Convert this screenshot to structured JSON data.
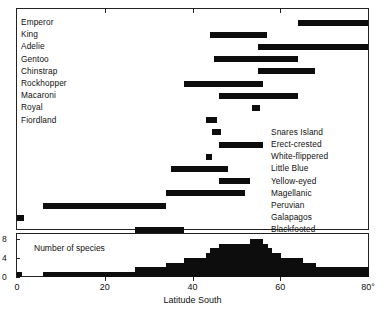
{
  "chart_data": {
    "type": "bar",
    "title": "",
    "subtitle": "",
    "xlabel": "Latitude South",
    "ylabel": "",
    "xlim": [
      0,
      80
    ],
    "xticks": [
      0,
      20,
      40,
      60,
      80
    ],
    "xtick_labels": [
      "0",
      "20",
      "40",
      "60",
      "80°"
    ],
    "grid": false,
    "legend": false,
    "orientation": "horizontal-range-bars",
    "note": "Latitudinal breeding ranges of penguin species (range bars) with histogram of number of species per latitude band",
    "categories": [
      "Emperor",
      "King",
      "Adelie",
      "Gentoo",
      "Chinstrap",
      "Rockhopper",
      "Macaroni",
      "Royal",
      "Fiordland",
      "Snares Island",
      "Erect-crested",
      "White-flippered",
      "Little Blue",
      "Yellow-eyed",
      "Magellanic",
      "Peruvian",
      "Galapagos",
      "Blackfooted"
    ],
    "ranges": [
      {
        "species": "Emperor",
        "start": 64,
        "end": 80,
        "label_side": "left"
      },
      {
        "species": "King",
        "start": 44,
        "end": 57,
        "label_side": "left"
      },
      {
        "species": "Adelie",
        "start": 55,
        "end": 80,
        "label_side": "left"
      },
      {
        "species": "Gentoo",
        "start": 45,
        "end": 64,
        "label_side": "left"
      },
      {
        "species": "Chinstrap",
        "start": 55,
        "end": 68,
        "label_side": "left"
      },
      {
        "species": "Rockhopper",
        "start": 38,
        "end": 56,
        "label_side": "left"
      },
      {
        "species": "Macaroni",
        "start": 46,
        "end": 64,
        "label_side": "left"
      },
      {
        "species": "Royal",
        "start": 53.5,
        "end": 55.5,
        "label_side": "left"
      },
      {
        "species": "Fiordland",
        "start": 43,
        "end": 45.5,
        "label_side": "left"
      },
      {
        "species": "Snares Island",
        "start": 44.5,
        "end": 46.5,
        "label_side": "right"
      },
      {
        "species": "Erect-crested",
        "start": 46,
        "end": 56,
        "label_side": "right"
      },
      {
        "species": "White-flippered",
        "start": 43,
        "end": 44.5,
        "label_side": "right"
      },
      {
        "species": "Little Blue",
        "start": 35,
        "end": 48,
        "label_side": "right"
      },
      {
        "species": "Yellow-eyed",
        "start": 46,
        "end": 53,
        "label_side": "right"
      },
      {
        "species": "Magellanic",
        "start": 34,
        "end": 52,
        "label_side": "right"
      },
      {
        "species": "Peruvian",
        "start": 6,
        "end": 34,
        "label_side": "right"
      },
      {
        "species": "Galapagos",
        "start": 0,
        "end": 1.5,
        "label_side": "right"
      },
      {
        "species": "Blackfooted",
        "start": 27,
        "end": 38,
        "label_side": "right"
      }
    ],
    "histogram": {
      "caption": "Number of species",
      "ylabel": "Number of species",
      "ylim": [
        0,
        9
      ],
      "yticks": [
        0,
        4,
        8
      ],
      "ytick_labels": [
        "0",
        "4",
        "8"
      ],
      "bin_width": 1,
      "bins_start": 0,
      "counts": [
        1,
        0,
        0,
        0,
        0,
        0,
        1,
        1,
        1,
        1,
        1,
        1,
        1,
        1,
        1,
        1,
        1,
        1,
        1,
        1,
        1,
        1,
        1,
        1,
        1,
        1,
        1,
        2,
        2,
        2,
        2,
        2,
        2,
        2,
        3,
        3,
        3,
        3,
        4,
        4,
        4,
        4,
        4,
        5,
        6,
        6,
        7,
        7,
        7,
        7,
        7,
        7,
        7,
        8,
        8,
        8,
        7,
        6,
        5,
        5,
        4,
        4,
        4,
        4,
        4,
        3,
        3,
        3,
        2,
        2,
        2,
        2,
        2,
        2,
        2,
        2,
        2,
        2,
        2,
        2
      ]
    }
  },
  "axis": {
    "x_title": "Latitude South",
    "x_tick_labels": [
      "0",
      "20",
      "40",
      "60",
      "80°"
    ],
    "hist_y_tick_labels": [
      "0",
      "4",
      "8"
    ],
    "hist_caption": "Number of species"
  },
  "colors": {
    "bar": "#0d0d0d",
    "frame": "#222222",
    "background": "#ffffff",
    "text": "#111111"
  }
}
